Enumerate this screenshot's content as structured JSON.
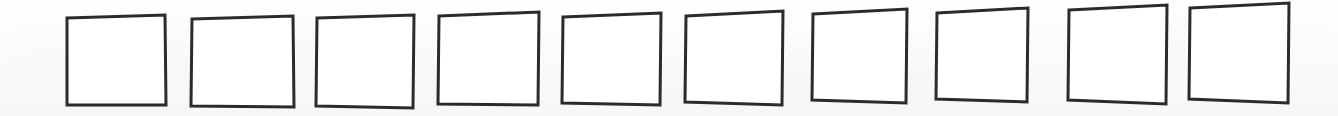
{
  "canvas": {
    "width": 1338,
    "height": 116,
    "background_color": "#fbfbfa",
    "paper_tone": "off-white scanned paper"
  },
  "figure": {
    "shape_kind": "square-outline",
    "count": 10,
    "fill_color": "#ffffff",
    "stroke_color": "#2b2b2b",
    "stroke_width_px": 3,
    "arrangement": "single horizontal row, evenly spaced, baseline drifting upward to the right"
  },
  "boxes": [
    {
      "index": 1,
      "label": "square-1",
      "x": 66,
      "y": 15,
      "width": 100,
      "height": 91,
      "corners": {
        "tl": [
          67,
          18
        ],
        "tr": [
          165,
          15
        ],
        "br": [
          166,
          105
        ],
        "bl": [
          67,
          105
        ]
      }
    },
    {
      "index": 2,
      "label": "square-2",
      "x": 191,
      "y": 16,
      "width": 103,
      "height": 91,
      "corners": {
        "tl": [
          192,
          19
        ],
        "tr": [
          293,
          16
        ],
        "br": [
          294,
          107
        ],
        "bl": [
          191,
          106
        ]
      }
    },
    {
      "index": 3,
      "label": "square-3",
      "x": 316,
      "y": 15,
      "width": 98,
      "height": 93,
      "corners": {
        "tl": [
          317,
          18
        ],
        "tr": [
          414,
          15
        ],
        "br": [
          413,
          108
        ],
        "bl": [
          316,
          106
        ]
      }
    },
    {
      "index": 4,
      "label": "square-4",
      "x": 438,
      "y": 12,
      "width": 101,
      "height": 93,
      "corners": {
        "tl": [
          439,
          16
        ],
        "tr": [
          539,
          12
        ],
        "br": [
          538,
          105
        ],
        "bl": [
          438,
          104
        ]
      }
    },
    {
      "index": 5,
      "label": "square-5",
      "x": 562,
      "y": 13,
      "width": 99,
      "height": 92,
      "corners": {
        "tl": [
          563,
          17
        ],
        "tr": [
          661,
          13
        ],
        "br": [
          660,
          105
        ],
        "bl": [
          562,
          103
        ]
      }
    },
    {
      "index": 6,
      "label": "square-6",
      "x": 685,
      "y": 11,
      "width": 98,
      "height": 94,
      "corners": {
        "tl": [
          686,
          16
        ],
        "tr": [
          783,
          11
        ],
        "br": [
          782,
          105
        ],
        "bl": [
          685,
          102
        ]
      }
    },
    {
      "index": 7,
      "label": "square-7",
      "x": 812,
      "y": 9,
      "width": 95,
      "height": 94,
      "corners": {
        "tl": [
          813,
          14
        ],
        "tr": [
          907,
          9
        ],
        "br": [
          906,
          103
        ],
        "bl": [
          812,
          100
        ]
      }
    },
    {
      "index": 8,
      "label": "square-8",
      "x": 936,
      "y": 8,
      "width": 92,
      "height": 94,
      "corners": {
        "tl": [
          937,
          13
        ],
        "tr": [
          1028,
          8
        ],
        "br": [
          1027,
          102
        ],
        "bl": [
          936,
          99
        ]
      }
    },
    {
      "index": 9,
      "label": "square-9",
      "x": 1068,
      "y": 5,
      "width": 99,
      "height": 99,
      "corners": {
        "tl": [
          1069,
          10
        ],
        "tr": [
          1167,
          5
        ],
        "br": [
          1166,
          104
        ],
        "bl": [
          1068,
          100
        ]
      }
    },
    {
      "index": 10,
      "label": "square-10",
      "x": 1189,
      "y": 3,
      "width": 100,
      "height": 100,
      "corners": {
        "tl": [
          1190,
          8
        ],
        "tr": [
          1289,
          3
        ],
        "br": [
          1288,
          103
        ],
        "bl": [
          1189,
          99
        ]
      }
    }
  ]
}
